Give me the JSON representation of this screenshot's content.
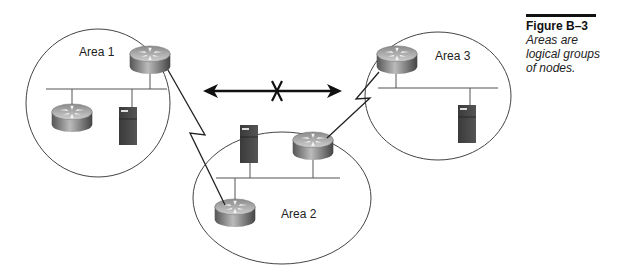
{
  "figure": {
    "number": "Figure B–3",
    "caption": [
      "Areas are",
      "logical groups",
      "of nodes."
    ]
  },
  "areas": [
    {
      "label": "Area 1",
      "devices": [
        "router",
        "router",
        "server"
      ]
    },
    {
      "label": "Area 2",
      "devices": [
        "server",
        "router",
        "router"
      ]
    },
    {
      "label": "Area 3",
      "devices": [
        "router",
        "server"
      ]
    }
  ],
  "links": [
    {
      "from": "Area 1 router",
      "to": "Area 2 router (bottom)",
      "type": "serial"
    },
    {
      "from": "Area 2 router (right)",
      "to": "Area 3 router",
      "type": "serial"
    }
  ],
  "annotation": {
    "type": "blocked-double-arrow",
    "between": [
      "Area 1",
      "Area 3"
    ],
    "mark": "X"
  }
}
